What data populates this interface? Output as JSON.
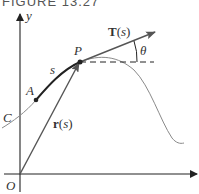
{
  "figure": {
    "caption": "FIGURE 13.27"
  },
  "labels": {
    "y_axis": "y",
    "origin": "O",
    "point_p": "P",
    "point_a": "A",
    "arc_length": "s",
    "curve": "C",
    "position_vector": "r(s)",
    "tangent_vector": "T(s)",
    "angle": "θ"
  },
  "colors": {
    "axis": "#222222",
    "curve_thin": "#8a8a8a",
    "curve_thick": "#222222",
    "vector": "#555555",
    "text": "#333333"
  }
}
